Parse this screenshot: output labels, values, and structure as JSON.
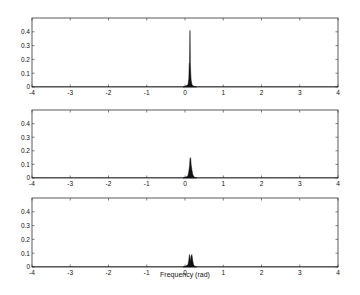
{
  "chart_data": [
    {
      "type": "area",
      "panel": "top",
      "title": "",
      "xlabel": "",
      "ylabel": "",
      "xlim": [
        -4,
        4
      ],
      "ylim": [
        0,
        0.5
      ],
      "xticks": [
        -4,
        -3,
        -2,
        -1,
        0,
        1,
        2,
        3,
        4
      ],
      "yticks": [
        0,
        0.1,
        0.2,
        0.3,
        0.4
      ],
      "grid": false,
      "series": [
        {
          "name": "spectrum",
          "x": [
            -0.05,
            0.0,
            0.05,
            0.08,
            0.1,
            0.11,
            0.12,
            0.13,
            0.14,
            0.15,
            0.16,
            0.18,
            0.2,
            0.25,
            0.3
          ],
          "y": [
            0,
            0.005,
            0.01,
            0.02,
            0.06,
            0.17,
            0.18,
            0.41,
            0.17,
            0.1,
            0.05,
            0.02,
            0.01,
            0.004,
            0
          ]
        }
      ]
    },
    {
      "type": "area",
      "panel": "middle",
      "title": "",
      "xlabel": "",
      "ylabel": "",
      "xlim": [
        -4,
        4
      ],
      "ylim": [
        0,
        0.5
      ],
      "xticks": [
        -4,
        -3,
        -2,
        -1,
        0,
        1,
        2,
        3,
        4
      ],
      "yticks": [
        0,
        0.1,
        0.2,
        0.3,
        0.4
      ],
      "grid": false,
      "series": [
        {
          "name": "spectrum",
          "x": [
            -0.05,
            0.0,
            0.05,
            0.08,
            0.1,
            0.12,
            0.13,
            0.14,
            0.15,
            0.16,
            0.18,
            0.2,
            0.22,
            0.25,
            0.3
          ],
          "y": [
            0,
            0.005,
            0.01,
            0.02,
            0.05,
            0.09,
            0.14,
            0.15,
            0.14,
            0.1,
            0.06,
            0.03,
            0.015,
            0.005,
            0
          ]
        }
      ]
    },
    {
      "type": "area",
      "panel": "bottom",
      "title": "",
      "xlabel": "Frequency (rad)",
      "ylabel": "",
      "xlim": [
        -4,
        4
      ],
      "ylim": [
        0,
        0.5
      ],
      "xticks": [
        -4,
        -3,
        -2,
        -1,
        0,
        1,
        2,
        3,
        4
      ],
      "yticks": [
        0,
        0.1,
        0.2,
        0.3,
        0.4
      ],
      "grid": false,
      "series": [
        {
          "name": "spectrum",
          "x": [
            -0.05,
            0.0,
            0.05,
            0.08,
            0.1,
            0.11,
            0.12,
            0.14,
            0.16,
            0.18,
            0.2,
            0.22,
            0.25,
            0.3
          ],
          "y": [
            0,
            0.005,
            0.01,
            0.02,
            0.05,
            0.08,
            0.09,
            0.04,
            0.08,
            0.09,
            0.05,
            0.02,
            0.005,
            0
          ]
        }
      ]
    }
  ],
  "axes": {
    "xtick_labels": [
      "-4",
      "-3",
      "-2",
      "-1",
      "0",
      "1",
      "2",
      "3",
      "4"
    ],
    "ytick_labels": [
      "0",
      "0.1",
      "0.2",
      "0.3",
      "0.4"
    ],
    "xlabel": "Frequency (rad)"
  },
  "colors": {
    "line": "#111111",
    "axes": "#333333",
    "background": "#ffffff"
  }
}
